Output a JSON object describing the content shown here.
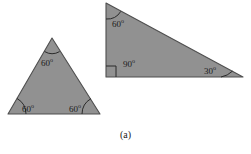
{
  "figure": {
    "caption": "(a)",
    "fill_color": "#8f8f8f",
    "stroke_color": "#4a4a4a",
    "arc_color": "#2b2b2b",
    "text_color": "#1b1b1b",
    "background_color": "#ffffff",
    "shapes": [
      {
        "id": "equilateral-triangle",
        "name": "equilateral-triangle",
        "type": "triangle",
        "points": "52,38 100,114 8,114",
        "angles": [
          {
            "id": "eq-apex",
            "name": "angle-label-60-apex",
            "value": "60",
            "degree_symbol": "o"
          },
          {
            "id": "eq-left",
            "name": "angle-label-60-bottom-left",
            "value": "60",
            "degree_symbol": "o"
          },
          {
            "id": "eq-right",
            "name": "angle-label-60-bottom-right",
            "value": "60",
            "degree_symbol": "o"
          }
        ]
      },
      {
        "id": "right-triangle",
        "name": "right-triangle",
        "type": "triangle",
        "points": "106,3 243,77 106,77",
        "angles": [
          {
            "id": "rt-top",
            "name": "angle-label-60-top-left",
            "value": "60",
            "degree_symbol": "o"
          },
          {
            "id": "rt-right",
            "name": "angle-label-90-bottom-left",
            "value": "90",
            "degree_symbol": "o"
          },
          {
            "id": "rt-low",
            "name": "angle-label-30-bottom-right",
            "value": "30",
            "degree_symbol": "o"
          }
        ]
      }
    ]
  },
  "labels": {
    "eq_apex": "60",
    "eq_left": "60",
    "eq_right": "60",
    "rt_top": "60",
    "rt_right": "90",
    "rt_low": "30",
    "degree": "o"
  }
}
